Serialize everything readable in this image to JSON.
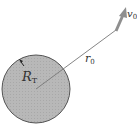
{
  "diagram": {
    "planet": {
      "label": "R",
      "label_sub": "T",
      "fill": "#b5b5b5",
      "stroke": "#555555"
    },
    "position_vector": {
      "label": "r",
      "label_sub": "0"
    },
    "velocity_vector": {
      "label": "v",
      "label_sub": "0",
      "color": "#8f8f8f"
    }
  }
}
